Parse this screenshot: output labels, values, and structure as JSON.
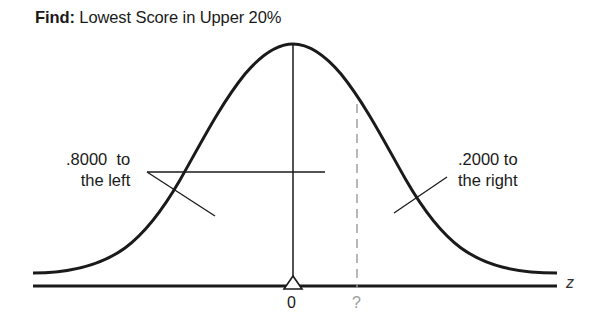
{
  "title": {
    "prefix": "Find:",
    "text": "Lowest Score in Upper 20%"
  },
  "labels": {
    "left_line1": ".8000  to",
    "left_line2": "the left",
    "right_line1": ".2000 to",
    "right_line2": "the right"
  },
  "axis": {
    "variable": "z",
    "tick_mean": "0",
    "tick_unknown": "?"
  },
  "colors": {
    "curve": "#1a1a1a",
    "axis": "#1a1a1a",
    "dashed": "#9a9a9a",
    "unknown_tick": "#9a9a9a"
  },
  "diagram": {
    "type": "normal-distribution",
    "area_left": 0.8,
    "area_right": 0.2,
    "cutoff_label": "?"
  }
}
